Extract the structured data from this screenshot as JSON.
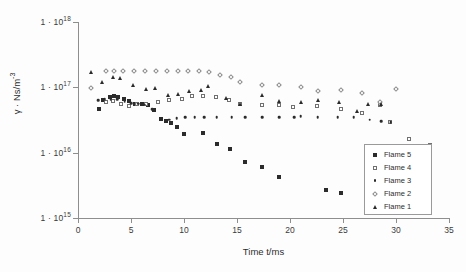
{
  "chart_data": {
    "type": "scatter",
    "title": "",
    "xlabel": "Time t/ms",
    "ylabel": "γ · Ns/m-3",
    "ylabel_base": "γ · Ns/m",
    "ylabel_exponent": "-3",
    "xlim": [
      0,
      35
    ],
    "ylim": [
      1000000000000000.0,
      1e+18
    ],
    "yscale": "log",
    "xscale": "linear",
    "grid": false,
    "legend_position": "inside-right",
    "xticks": [
      0,
      5,
      10,
      15,
      20,
      25,
      30,
      35
    ],
    "xtick_labels": [
      "0",
      "5",
      "10",
      "15",
      "20",
      "25",
      "30",
      "35"
    ],
    "yticks": [
      1000000000000000.0,
      1e+16,
      1e+17,
      1e+18
    ],
    "ytick_labels": [
      {
        "mantissa": "1 · 10",
        "exponent": "15"
      },
      {
        "mantissa": "1 · 10",
        "exponent": "16"
      },
      {
        "mantissa": "1 · 10",
        "exponent": "17"
      },
      {
        "mantissa": "1 · 10",
        "exponent": "18"
      }
    ],
    "series": [
      {
        "name": "Flame 5",
        "marker": "filled-square",
        "color": "#2b2b2b",
        "x": [
          2.0,
          2.4,
          3.0,
          3.4,
          3.8,
          4.3,
          4.8,
          5.4,
          6.0,
          6.6,
          7.2,
          7.8,
          8.3,
          8.8,
          9.3,
          10.0,
          11.8,
          13.1,
          14.3,
          15.8,
          17.4,
          19.0,
          23.4,
          24.8
        ],
        "y": [
          4.7e+16,
          6.3e+16,
          7e+16,
          7.4e+16,
          7.2e+16,
          6.6e+16,
          6.2e+16,
          5.6e+16,
          5.5e+16,
          5.4e+16,
          4.5e+16,
          3.3e+16,
          3.1e+16,
          2.8e+16,
          2.5e+16,
          1.9e+16,
          2e+16,
          1.35e+16,
          1.15e+16,
          7300000000000000.0,
          6000000000000000.0,
          4200000000000000.0,
          2700000000000000.0,
          2400000000000000.0
        ]
      },
      {
        "name": "Flame 4",
        "marker": "open-square",
        "color": "#707070",
        "x": [
          2.6,
          3.3,
          4.1,
          4.8,
          5.6,
          6.4,
          7.5,
          8.6,
          9.8,
          10.8,
          11.8,
          13.0,
          14.2,
          15.3,
          17.4,
          19.0,
          20.3,
          22.5,
          24.8,
          26.8,
          28.5,
          29.4,
          31.2,
          33.2
        ],
        "y": [
          6e+16,
          6.1e+16,
          5.6e+16,
          5.2e+16,
          5.6e+16,
          5.6e+16,
          6e+16,
          6.3e+16,
          6.6e+16,
          7.3e+16,
          7.4e+16,
          7e+16,
          6.5e+16,
          5.6e+16,
          5.4e+16,
          5.4e+16,
          5e+16,
          5.2e+16,
          4.6e+16,
          4e+16,
          5.4e+16,
          2.9e+16,
          1.6e+16,
          1.3e+16
        ]
      },
      {
        "name": "Flame 3",
        "marker": "dot",
        "color": "#2b2b2b",
        "x": [
          1.9,
          2.5,
          3.1,
          3.7,
          4.4,
          5.0,
          5.7,
          6.3,
          7.0,
          7.8,
          8.6,
          9.3,
          10.1,
          11.0,
          11.9,
          13.1,
          14.5,
          15.8,
          17.4,
          19.0,
          20.4,
          21.0,
          22.6,
          24.5,
          26.0,
          27.5,
          28.6,
          29.5
        ],
        "y": [
          6.3e+16,
          6.6e+16,
          6.6e+16,
          6.6e+16,
          6e+16,
          5.7e+16,
          5.6e+16,
          5.4e+16,
          4.6e+16,
          3.3e+16,
          3.2e+16,
          3.4e+16,
          3.5e+16,
          3.5e+16,
          3.5e+16,
          3.5e+16,
          3.5e+16,
          3.5e+16,
          3.5e+16,
          3.5e+16,
          3.5e+16,
          3.6e+16,
          3.5e+16,
          3.5e+16,
          3.5e+16,
          3.2e+16,
          3e+16,
          2.9e+16
        ]
      },
      {
        "name": "Flame 2",
        "marker": "open-diamond",
        "color": "#8a8a8a",
        "x": [
          1.2,
          2.6,
          3.4,
          4.2,
          5.3,
          6.3,
          7.4,
          8.4,
          9.4,
          10.4,
          11.4,
          12.4,
          13.4,
          14.4,
          15.3,
          17.4,
          19.0,
          21.0,
          22.6,
          24.8,
          26.8,
          28.5,
          30.0
        ],
        "y": [
          9.6e+16,
          1.75e+17,
          1.78e+17,
          1.78e+17,
          1.76e+17,
          1.78e+17,
          1.78e+17,
          1.78e+17,
          1.78e+17,
          1.76e+17,
          1.76e+17,
          1.72e+17,
          1.55e+17,
          1.42e+17,
          1.22e+17,
          1.08e+17,
          1.08e+17,
          1e+17,
          8.8e+16,
          9e+16,
          8.2e+16,
          6e+16,
          9.4e+16
        ]
      },
      {
        "name": "Flame 1",
        "marker": "filled-triangle",
        "color": "#2b2b2b",
        "x": [
          1.2,
          2.3,
          3.3,
          4.0,
          5.2,
          6.4,
          7.3,
          8.5,
          9.4,
          10.5,
          11.6,
          12.3,
          14.0,
          15.3,
          17.4,
          19.0,
          21.0,
          22.6,
          24.6,
          26.3,
          27.4,
          28.6
        ],
        "y": [
          1.7e+17,
          1.2e+17,
          1.45e+17,
          1.4e+17,
          1.1e+17,
          9.3e+16,
          9.6e+16,
          7.5e+16,
          8e+16,
          8.8e+16,
          9.2e+16,
          1.05e+17,
          6.8e+16,
          5.6e+16,
          7.6e+16,
          6.2e+16,
          6e+16,
          6.4e+16,
          6e+16,
          4.4e+16,
          5.6e+16,
          5.6e+16
        ]
      }
    ]
  },
  "legend": {
    "items": [
      {
        "label": "Flame 5",
        "marker": "filled-square"
      },
      {
        "label": "Flame 4",
        "marker": "open-square"
      },
      {
        "label": "Flame 3",
        "marker": "dot"
      },
      {
        "label": "Flame 2",
        "marker": "open-diamond"
      },
      {
        "label": "Flame 1",
        "marker": "filled-triangle"
      }
    ]
  }
}
